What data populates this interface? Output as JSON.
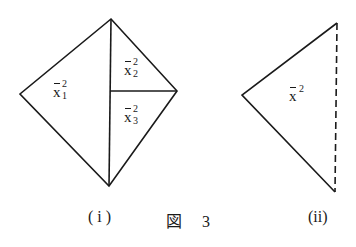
{
  "figure": {
    "title_char": "図",
    "number": "3",
    "panels": [
      {
        "id": "i",
        "caption": "( i )",
        "regions": [
          {
            "base": "x",
            "sup": "2",
            "sub": "1"
          },
          {
            "base": "x",
            "sup": "2",
            "sub": "2"
          },
          {
            "base": "x",
            "sup": "2",
            "sub": "3"
          }
        ]
      },
      {
        "id": "ii",
        "caption": "(ii)",
        "regions": [
          {
            "base": "x",
            "sup": "2",
            "sub": ""
          }
        ],
        "dashed_edge": "right"
      }
    ]
  },
  "colors": {
    "line": "#1a1a1a",
    "background": "#ffffff"
  }
}
